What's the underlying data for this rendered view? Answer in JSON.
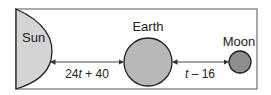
{
  "diagram": {
    "labels": {
      "sun": "Sun",
      "earth": "Earth",
      "moon": "Moon"
    },
    "distances": {
      "sun_earth": {
        "coef": "24",
        "var": "t",
        "rest": " + 40"
      },
      "earth_moon": {
        "var": "t",
        "rest": " – 16"
      }
    },
    "colors": {
      "sun": "#d4d4d4",
      "earth": "#b8b8b8",
      "moon": "#8e8e8e",
      "frame": "#555555"
    }
  }
}
